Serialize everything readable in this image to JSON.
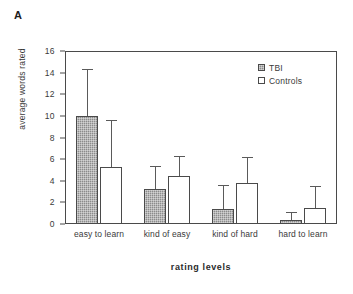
{
  "panel": {
    "label": "A"
  },
  "chart_data": {
    "type": "bar",
    "title": "",
    "subtitle": "",
    "xlabel": "rating  levels",
    "ylabel": "average words rated",
    "categories": [
      "easy to learn",
      "kind of easy",
      "kind of hard",
      "hard to learn"
    ],
    "ylim": [
      0,
      16
    ],
    "yticks": [
      0,
      2,
      4,
      6,
      8,
      10,
      12,
      14,
      16
    ],
    "ytick_labels": [
      "0",
      "2",
      "4",
      "6",
      "8",
      "10",
      "12",
      "14",
      "16"
    ],
    "grid": false,
    "legend_position": "top-right",
    "error_bars": "upper-only",
    "series": [
      {
        "name": "TBI",
        "color": "#8c8c8c",
        "fill": "checkered-gray",
        "values": [
          10.0,
          3.2,
          1.4,
          0.4
        ],
        "errors_upper": [
          14.2,
          5.3,
          3.5,
          1.0
        ]
      },
      {
        "name": "Controls",
        "color": "#ffffff",
        "fill": "white",
        "values": [
          5.3,
          4.4,
          3.8,
          1.5
        ],
        "errors_upper": [
          9.5,
          6.2,
          6.1,
          3.4
        ]
      }
    ]
  },
  "legend": {
    "items": [
      {
        "label": "TBI",
        "swatch": "filled-gray-square-icon"
      },
      {
        "label": "Controls",
        "swatch": "open-white-square-icon"
      }
    ]
  }
}
